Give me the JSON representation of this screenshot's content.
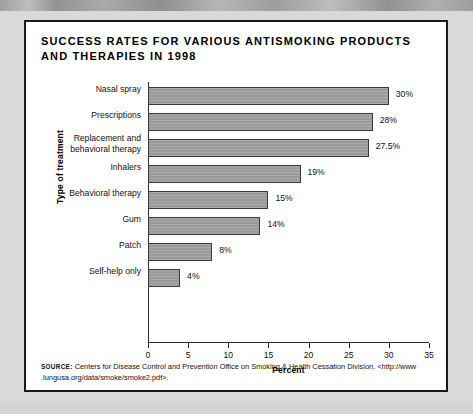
{
  "figure": {
    "title": "SUCCESS RATES FOR VARIOUS ANTISMOKING PRODUCTS AND THERAPIES IN 1998",
    "source_label": "SOURCE:",
    "source_text": " Centers for Disease Control and Prevention Office on Smoking & Health Cessation Division. <http://www .lungusa.org/data/smoke/smoke2.pdf>."
  },
  "chart_data": {
    "type": "bar",
    "orientation": "horizontal",
    "title": "SUCCESS RATES FOR VARIOUS ANTISMOKING PRODUCTS AND THERAPIES IN 1998",
    "xlabel": "Percent",
    "ylabel": "Type of treatment",
    "xlim": [
      0,
      35
    ],
    "xticks": [
      0,
      5,
      10,
      15,
      20,
      25,
      30,
      35
    ],
    "xtick_labels": [
      "0",
      "5",
      "10",
      "15",
      "20",
      "25",
      "30",
      "35"
    ],
    "grid": false,
    "legend": false,
    "bar_color": "#9a9a9a",
    "bar_edge_color": "#3a3a3a",
    "categories": [
      "Nasal spray",
      "Prescriptions",
      "Replacement and behavioral therapy",
      "Inhalers",
      "Behavioral therapy",
      "Gum",
      "Patch",
      "Self-help only"
    ],
    "values": [
      30,
      28,
      27.5,
      19,
      15,
      14,
      8,
      4
    ],
    "value_labels": [
      "30%",
      "28%",
      "27.5%",
      "19%",
      "15%",
      "14%",
      "8%",
      "4%"
    ],
    "bars": [
      {
        "category": "Nasal spray",
        "category_line1": "Nasal spray",
        "category_line2": "",
        "value": 30,
        "label": "30%"
      },
      {
        "category": "Prescriptions",
        "category_line1": "Prescriptions",
        "category_line2": "",
        "value": 28,
        "label": "28%"
      },
      {
        "category": "Replacement and behavioral therapy",
        "category_line1": "Replacement and",
        "category_line2": "behavioral therapy",
        "value": 27.5,
        "label": "27.5%"
      },
      {
        "category": "Inhalers",
        "category_line1": "Inhalers",
        "category_line2": "",
        "value": 19,
        "label": "19%"
      },
      {
        "category": "Behavioral therapy",
        "category_line1": "Behavioral therapy",
        "category_line2": "",
        "value": 15,
        "label": "15%"
      },
      {
        "category": "Gum",
        "category_line1": "Gum",
        "category_line2": "",
        "value": 14,
        "label": "14%"
      },
      {
        "category": "Patch",
        "category_line1": "Patch",
        "category_line2": "",
        "value": 8,
        "label": "8%"
      },
      {
        "category": "Self-help only",
        "category_line1": "Self-help only",
        "category_line2": "",
        "value": 4,
        "label": "4%"
      }
    ]
  }
}
